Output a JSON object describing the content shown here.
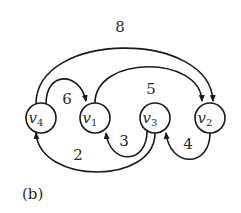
{
  "figure": {
    "caption": "(b)",
    "nodes": [
      {
        "id": "v4",
        "base": "v",
        "sub": "4",
        "cx": 41,
        "cy": 118
      },
      {
        "id": "v1",
        "base": "v",
        "sub": "1",
        "cx": 95,
        "cy": 118
      },
      {
        "id": "v3",
        "base": "v",
        "sub": "3",
        "cx": 155,
        "cy": 118
      },
      {
        "id": "v2",
        "base": "v",
        "sub": "2",
        "cx": 210,
        "cy": 118
      }
    ],
    "edges": [
      {
        "from": "v4",
        "to": "v2",
        "weight": "8"
      },
      {
        "from": "v4",
        "to": "v1",
        "weight": "6"
      },
      {
        "from": "v1",
        "to": "v2",
        "weight": "5"
      },
      {
        "from": "v3",
        "to": "v1",
        "weight": "3"
      },
      {
        "from": "v2",
        "to": "v3",
        "weight": "4"
      },
      {
        "from": "v3",
        "to": "v4",
        "weight": "2"
      }
    ],
    "colors": {
      "stroke": "#1a1a1a",
      "text": "#2a2a2a",
      "background": "#ffffff"
    }
  }
}
